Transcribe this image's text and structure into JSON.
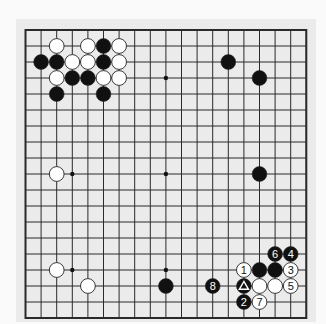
{
  "diagram": {
    "type": "go-board",
    "size": 19,
    "colors": {
      "page_bg": "#fafafa",
      "board_fill": "#ebebeb",
      "grid_line": "#2a2a2a",
      "black_stone": "#111111",
      "white_stone": "#ffffff",
      "stone_outline": "#222222"
    },
    "hoshi": [
      [
        3,
        3
      ],
      [
        9,
        3
      ],
      [
        15,
        3
      ],
      [
        3,
        9
      ],
      [
        9,
        9
      ],
      [
        15,
        9
      ],
      [
        3,
        15
      ],
      [
        9,
        15
      ],
      [
        15,
        15
      ]
    ],
    "stones": [
      {
        "col": 2,
        "row": 1,
        "color": "white",
        "label": ""
      },
      {
        "col": 4,
        "row": 1,
        "color": "white",
        "label": ""
      },
      {
        "col": 5,
        "row": 1,
        "color": "black",
        "label": ""
      },
      {
        "col": 6,
        "row": 1,
        "color": "white",
        "label": ""
      },
      {
        "col": 1,
        "row": 2,
        "color": "black",
        "label": ""
      },
      {
        "col": 2,
        "row": 2,
        "color": "black",
        "label": ""
      },
      {
        "col": 3,
        "row": 2,
        "color": "white",
        "label": ""
      },
      {
        "col": 4,
        "row": 2,
        "color": "white",
        "label": ""
      },
      {
        "col": 5,
        "row": 2,
        "color": "black",
        "label": ""
      },
      {
        "col": 6,
        "row": 2,
        "color": "white",
        "label": ""
      },
      {
        "col": 2,
        "row": 3,
        "color": "white",
        "label": ""
      },
      {
        "col": 3,
        "row": 3,
        "color": "black",
        "label": ""
      },
      {
        "col": 4,
        "row": 3,
        "color": "black",
        "label": ""
      },
      {
        "col": 5,
        "row": 3,
        "color": "white",
        "label": ""
      },
      {
        "col": 6,
        "row": 3,
        "color": "white",
        "label": ""
      },
      {
        "col": 2,
        "row": 4,
        "color": "black",
        "label": ""
      },
      {
        "col": 5,
        "row": 4,
        "color": "black",
        "label": ""
      },
      {
        "col": 13,
        "row": 2,
        "color": "black",
        "label": ""
      },
      {
        "col": 15,
        "row": 3,
        "color": "black",
        "label": ""
      },
      {
        "col": 2,
        "row": 9,
        "color": "white",
        "label": ""
      },
      {
        "col": 15,
        "row": 9,
        "color": "black",
        "label": ""
      },
      {
        "col": 2,
        "row": 15,
        "color": "white",
        "label": ""
      },
      {
        "col": 4,
        "row": 16,
        "color": "white",
        "label": ""
      },
      {
        "col": 9,
        "row": 16,
        "color": "black",
        "label": ""
      },
      {
        "col": 16,
        "row": 14,
        "color": "black",
        "label": "6"
      },
      {
        "col": 17,
        "row": 14,
        "color": "black",
        "label": "4"
      },
      {
        "col": 14,
        "row": 15,
        "color": "white",
        "label": "1"
      },
      {
        "col": 15,
        "row": 15,
        "color": "black",
        "label": ""
      },
      {
        "col": 16,
        "row": 15,
        "color": "black",
        "label": ""
      },
      {
        "col": 17,
        "row": 15,
        "color": "white",
        "label": "3"
      },
      {
        "col": 12,
        "row": 16,
        "color": "black",
        "label": "8"
      },
      {
        "col": 14,
        "row": 16,
        "color": "black",
        "label": "",
        "marker": "triangle"
      },
      {
        "col": 15,
        "row": 16,
        "color": "white",
        "label": ""
      },
      {
        "col": 16,
        "row": 16,
        "color": "white",
        "label": ""
      },
      {
        "col": 17,
        "row": 16,
        "color": "white",
        "label": "5"
      },
      {
        "col": 14,
        "row": 17,
        "color": "black",
        "label": "2"
      },
      {
        "col": 15,
        "row": 17,
        "color": "white",
        "label": "7"
      }
    ]
  }
}
